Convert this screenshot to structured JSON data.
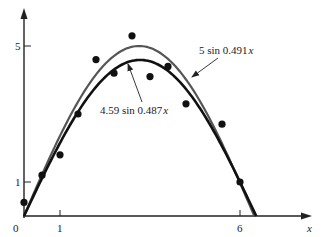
{
  "chart_data": {
    "type": "scatter",
    "title": "",
    "xlabel": "x",
    "ylabel": "",
    "x_ticks": [
      "0",
      "1",
      "6"
    ],
    "y_ticks": [
      "1",
      "5"
    ],
    "xlim": [
      0,
      7.9
    ],
    "ylim": [
      0,
      6.3
    ],
    "grid": false,
    "points": [
      {
        "x": 0.0,
        "y": 0.4
      },
      {
        "x": 0.5,
        "y": 1.2
      },
      {
        "x": 1.0,
        "y": 1.8
      },
      {
        "x": 1.5,
        "y": 3.0
      },
      {
        "x": 2.0,
        "y": 4.6
      },
      {
        "x": 2.5,
        "y": 4.2
      },
      {
        "x": 3.0,
        "y": 5.3
      },
      {
        "x": 3.5,
        "y": 4.1
      },
      {
        "x": 4.0,
        "y": 4.4
      },
      {
        "x": 4.5,
        "y": 3.3
      },
      {
        "x": 5.5,
        "y": 2.7
      },
      {
        "x": 6.0,
        "y": 1.0
      }
    ],
    "series": [
      {
        "name": "5 sin 0.491x",
        "amplitude": 5,
        "frequency": 0.491,
        "color": "#555555"
      },
      {
        "name": "4.59 sin 0.487x",
        "amplitude": 4.59,
        "frequency": 0.487,
        "color": "#111111"
      }
    ],
    "annotations": [
      {
        "text_main": "5 sin 0.491",
        "text_var": "x",
        "arrow_to_series": "5 sin 0.491x"
      },
      {
        "text_main": "4.59 sin 0.487",
        "text_var": "x",
        "arrow_to_series": "4.59 sin 0.487x"
      }
    ]
  }
}
